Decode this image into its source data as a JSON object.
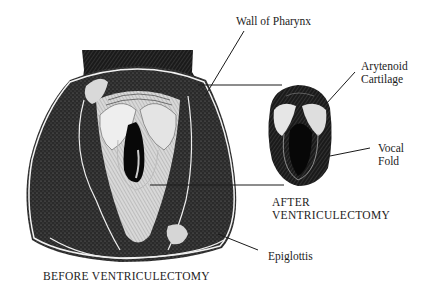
{
  "diagram": {
    "labels": {
      "wall_of_pharynx": "Wall of Pharynx",
      "arytenoid_line1": "Arytenoid",
      "arytenoid_line2": "Cartilage",
      "vocal_line1": "Vocal",
      "vocal_line2": "Fold",
      "epiglottis": "Epiglottis"
    },
    "captions": {
      "after_line1": "AFTER",
      "after_line2": "VENTRICULECTOMY",
      "before": "BEFORE VENTRICULECTOMY"
    },
    "colors": {
      "ink": "#111111",
      "paper": "#ffffff",
      "highlight": "#e8e8e8"
    }
  }
}
